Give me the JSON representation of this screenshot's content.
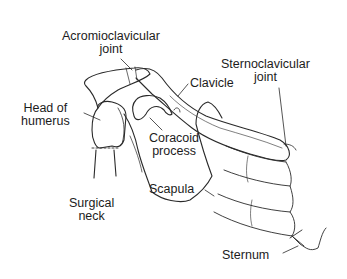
{
  "diagram": {
    "colors": {
      "background": "#ffffff",
      "line": "#2a2a2a",
      "text": "#1c1c1c"
    },
    "labels": {
      "acromioclavicular": {
        "line1": "Acromioclavicular",
        "line2": "joint"
      },
      "sternoclavicular": {
        "line1": "Sternoclavicular",
        "line2": "joint"
      },
      "clavicle": {
        "line1": "Clavicle"
      },
      "head_of_humerus": {
        "line1": "Head of",
        "line2": "humerus"
      },
      "coracoid_process": {
        "line1": "Coracoid",
        "line2": "process"
      },
      "scapula": {
        "line1": "Scapula"
      },
      "surgical_neck": {
        "line1": "Surgical",
        "line2": "neck"
      },
      "sternum": {
        "line1": "Sternum"
      }
    }
  }
}
